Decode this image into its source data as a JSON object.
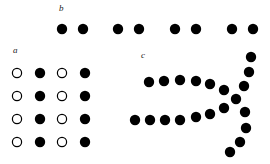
{
  "panels": {
    "a": {
      "label": "a",
      "label_pos": [
        13,
        48
      ],
      "dots": [
        {
          "x": 17,
          "y": 73,
          "filled": false
        },
        {
          "x": 40,
          "y": 73,
          "filled": true
        },
        {
          "x": 62,
          "y": 73,
          "filled": false
        },
        {
          "x": 85,
          "y": 73,
          "filled": true
        },
        {
          "x": 17,
          "y": 96,
          "filled": false
        },
        {
          "x": 40,
          "y": 96,
          "filled": true
        },
        {
          "x": 62,
          "y": 96,
          "filled": false
        },
        {
          "x": 85,
          "y": 96,
          "filled": true
        },
        {
          "x": 17,
          "y": 119,
          "filled": false
        },
        {
          "x": 40,
          "y": 119,
          "filled": true
        },
        {
          "x": 62,
          "y": 119,
          "filled": false
        },
        {
          "x": 85,
          "y": 119,
          "filled": true
        },
        {
          "x": 17,
          "y": 142,
          "filled": false
        },
        {
          "x": 40,
          "y": 142,
          "filled": true
        },
        {
          "x": 62,
          "y": 142,
          "filled": false
        },
        {
          "x": 85,
          "y": 142,
          "filled": true
        }
      ]
    },
    "b": {
      "label": "b",
      "label_pos": [
        59,
        5
      ],
      "dots": [
        {
          "x": 62,
          "y": 29
        },
        {
          "x": 83,
          "y": 29
        },
        {
          "x": 118,
          "y": 29
        },
        {
          "x": 139,
          "y": 29
        },
        {
          "x": 175,
          "y": 29
        },
        {
          "x": 196,
          "y": 29
        },
        {
          "x": 232,
          "y": 29
        },
        {
          "x": 253,
          "y": 29
        }
      ]
    },
    "c": {
      "label": "c",
      "label_pos": [
        141,
        52
      ],
      "dots": [
        {
          "x": 149,
          "y": 82
        },
        {
          "x": 164,
          "y": 81
        },
        {
          "x": 180,
          "y": 80
        },
        {
          "x": 196,
          "y": 81
        },
        {
          "x": 210,
          "y": 84
        },
        {
          "x": 224,
          "y": 90
        },
        {
          "x": 135,
          "y": 120
        },
        {
          "x": 150,
          "y": 120
        },
        {
          "x": 165,
          "y": 120
        },
        {
          "x": 180,
          "y": 120
        },
        {
          "x": 196,
          "y": 117
        },
        {
          "x": 210,
          "y": 114
        },
        {
          "x": 224,
          "y": 108
        },
        {
          "x": 251,
          "y": 57
        },
        {
          "x": 249,
          "y": 72
        },
        {
          "x": 244,
          "y": 86
        },
        {
          "x": 236,
          "y": 99
        },
        {
          "x": 245,
          "y": 112
        },
        {
          "x": 246,
          "y": 128
        },
        {
          "x": 240,
          "y": 142
        },
        {
          "x": 230,
          "y": 152
        }
      ]
    }
  },
  "style": {
    "dot_color": "#000000",
    "dot_radius": 5.2,
    "open_radius": 4.6
  }
}
